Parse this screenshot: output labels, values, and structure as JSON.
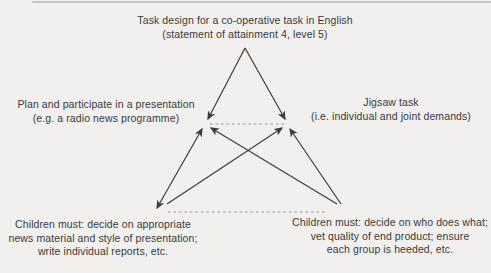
{
  "diagram": {
    "colors": {
      "background": "#f1f0ee",
      "ink": "#3a3a3a",
      "dashed_line": "#999693"
    },
    "nodes": {
      "top": {
        "id": "task-design",
        "lines": [
          "Task design for a co-operative task in English",
          "(statement of attainment 4, level 5)"
        ]
      },
      "left": {
        "id": "presentation-task",
        "lines": [
          "Plan and participate in a presentation",
          "(e.g. a radio news programme)"
        ]
      },
      "right": {
        "id": "jigsaw-task",
        "lines": [
          "Jigsaw task",
          "(i.e. individual and joint demands)"
        ]
      },
      "bottom_left": {
        "id": "children-presentation-demands",
        "lines": [
          "Children must: decide on appropriate",
          "news material and style of presentation;",
          "write individual reports, etc."
        ]
      },
      "bottom_right": {
        "id": "children-jigsaw-demands",
        "lines": [
          "Children must: decide on who does what;",
          "vet quality of end product; ensure",
          "each group is heeded, etc."
        ]
      }
    },
    "connections": [
      {
        "from": "task-design",
        "to": "presentation-task",
        "style": "solid",
        "arrowheads": "end"
      },
      {
        "from": "task-design",
        "to": "jigsaw-task",
        "style": "solid",
        "arrowheads": "end"
      },
      {
        "from": "children-presentation-demands",
        "to": "presentation-task",
        "style": "solid",
        "arrowheads": "both"
      },
      {
        "from": "children-presentation-demands",
        "to": "jigsaw-task",
        "style": "solid",
        "arrowheads": "end"
      },
      {
        "from": "children-jigsaw-demands",
        "to": "presentation-task",
        "style": "solid",
        "arrowheads": "end"
      },
      {
        "from": "children-jigsaw-demands",
        "to": "jigsaw-task",
        "style": "solid",
        "arrowheads": "end"
      },
      {
        "from": "presentation-task",
        "to": "jigsaw-task",
        "style": "dashed",
        "arrowheads": "none"
      },
      {
        "from": "children-presentation-demands",
        "to": "children-jigsaw-demands",
        "style": "dashed",
        "arrowheads": "none"
      }
    ]
  }
}
